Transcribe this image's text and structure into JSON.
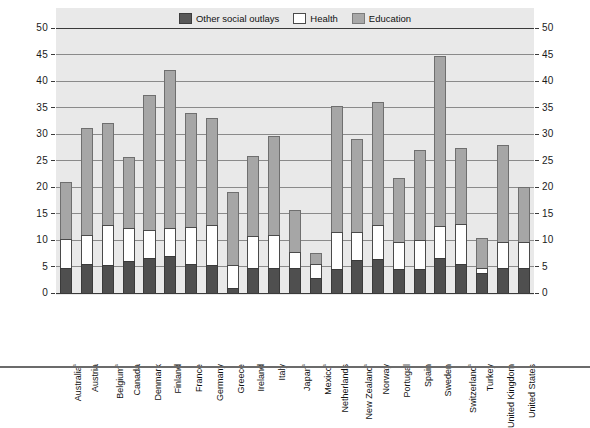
{
  "legend": {
    "items": [
      {
        "label": "Other social outlays",
        "key": "other",
        "color": "#4f4f4f"
      },
      {
        "label": "Health",
        "key": "health",
        "color": "#ffffff"
      },
      {
        "label": "Education",
        "key": "education",
        "color": "#a6a6a6"
      }
    ]
  },
  "axis": {
    "y_ticks": [
      "0",
      "5",
      "10",
      "15",
      "20",
      "25",
      "30",
      "35",
      "40",
      "45",
      "50"
    ]
  },
  "chart_data": {
    "type": "bar",
    "subtype": "stacked",
    "title": "",
    "xlabel": "",
    "ylabel": "",
    "ylim": [
      0,
      50
    ],
    "ystep": 5,
    "grid": true,
    "legend_position": "top-center",
    "categories": [
      "Australia¹",
      "Austria",
      "Belgium¹",
      "Canada",
      "Denmark",
      "Finland",
      "France",
      "Germany",
      "Greece",
      "Ireland",
      "Italy",
      "Japan¹",
      "Mexico¹",
      "Netherlands",
      "New Zealand¹",
      "Norway",
      "Portugal",
      "Spain",
      "Sweden",
      "Switzerland¹",
      "Turkey",
      "United Kingdom",
      "United States"
    ],
    "series": [
      {
        "name": "Other social outlays",
        "color": "#4f4f4f",
        "values": [
          4.7,
          5.4,
          5.3,
          6.0,
          6.6,
          7.0,
          5.4,
          5.3,
          1.0,
          4.8,
          4.8,
          4.7,
          2.8,
          4.6,
          6.3,
          6.5,
          4.5,
          4.6,
          6.6,
          5.4,
          3.8,
          4.7,
          4.7
        ]
      },
      {
        "name": "Health",
        "color": "#ffffff",
        "values": [
          5.4,
          5.6,
          7.5,
          6.2,
          5.3,
          5.3,
          7.0,
          7.6,
          4.3,
          5.9,
          6.1,
          3.0,
          2.7,
          6.9,
          5.3,
          6.3,
          5.1,
          5.4,
          6.1,
          7.7,
          1.0,
          5.0,
          4.9
        ]
      },
      {
        "name": "Education",
        "color": "#a6a6a6",
        "values": [
          10.9,
          20.1,
          19.2,
          13.5,
          25.5,
          29.7,
          21.6,
          20.1,
          13.8,
          15.1,
          18.7,
          7.9,
          2.1,
          23.8,
          17.4,
          23.2,
          12.1,
          17.0,
          32.0,
          14.2,
          5.5,
          18.3,
          10.4
        ]
      }
    ],
    "totals": [
      21.0,
      31.1,
      32.0,
      25.7,
      37.4,
      42.0,
      34.0,
      33.0,
      19.1,
      25.8,
      29.6,
      15.6,
      7.6,
      35.3,
      29.0,
      36.0,
      21.7,
      27.0,
      44.7,
      27.3,
      10.3,
      28.0,
      20.0
    ]
  }
}
